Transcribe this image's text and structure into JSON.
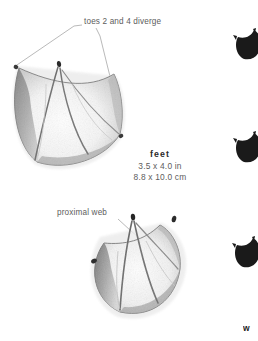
{
  "page": {
    "background_color": "#ffffff",
    "text_color": "#5d5d5d",
    "heading_color": "#2b2b2b",
    "silhouette_color": "#1a1a1a"
  },
  "callouts": {
    "toes": "toes 2 and 4 diverge",
    "web": "proximal web"
  },
  "measurements": {
    "title": "feet",
    "imperial": "3.5 x 4.0 in",
    "metric": "8.8 x 10.0 cm"
  },
  "edge_fragment": {
    "text": "w"
  },
  "illustrations": [
    {
      "name": "upper-webbed-track",
      "description": "pencil-shaded webbed foot track, toes 2 and 4 diverging"
    },
    {
      "name": "lower-webbed-track",
      "description": "pencil-shaded webbed foot track showing proximal web and claw marks"
    }
  ],
  "silhouettes": [
    {
      "name": "track-silhouette-1"
    },
    {
      "name": "track-silhouette-2"
    },
    {
      "name": "track-silhouette-3"
    }
  ]
}
